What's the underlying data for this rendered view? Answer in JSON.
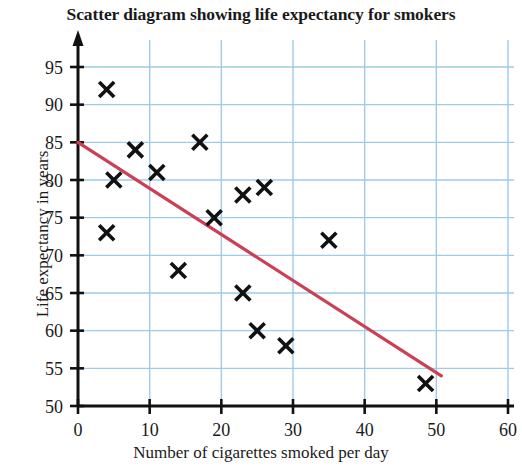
{
  "chart_data": {
    "type": "scatter",
    "title": "Scatter diagram showing life expectancy for smokers",
    "xlabel": "Number of cigarettes smoked per day",
    "ylabel": "Life expectancy in years",
    "xlim": [
      0,
      60
    ],
    "ylim": [
      50,
      95
    ],
    "xticks": [
      0,
      10,
      20,
      30,
      40,
      50,
      60
    ],
    "yticks": [
      50,
      55,
      60,
      65,
      70,
      75,
      80,
      85,
      90,
      95
    ],
    "grid": true,
    "grid_color": "#9ecbe8",
    "legend": null,
    "marker": "x",
    "marker_color": "#111111",
    "points": [
      {
        "x": 4,
        "y": 92
      },
      {
        "x": 5,
        "y": 80
      },
      {
        "x": 4,
        "y": 73
      },
      {
        "x": 8,
        "y": 84
      },
      {
        "x": 11,
        "y": 81
      },
      {
        "x": 14,
        "y": 68
      },
      {
        "x": 17,
        "y": 85
      },
      {
        "x": 19,
        "y": 75
      },
      {
        "x": 23,
        "y": 78
      },
      {
        "x": 26,
        "y": 79
      },
      {
        "x": 23,
        "y": 65
      },
      {
        "x": 25,
        "y": 60
      },
      {
        "x": 29,
        "y": 58
      },
      {
        "x": 35,
        "y": 72
      },
      {
        "x": 48.5,
        "y": 53
      }
    ],
    "trend_line": {
      "color": "#cc4055",
      "start": {
        "x": 0,
        "y": 85
      },
      "end": {
        "x": 50.7,
        "y": 54
      }
    }
  }
}
